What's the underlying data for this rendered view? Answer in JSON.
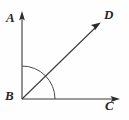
{
  "figure": {
    "type": "geometry-angle-diagram",
    "width": 129,
    "height": 120,
    "background_color": "#fefefe",
    "stroke_color": "#3a3a3a",
    "label_color": "#262626"
  },
  "vertex": {
    "name": "B",
    "label": "B",
    "x": 22,
    "y": 99
  },
  "rays": [
    {
      "name": "ray-BA",
      "label": "A",
      "from": "B",
      "to": "A",
      "direction": "up",
      "angle_degrees": 90,
      "tip_x": 22,
      "tip_y": 12,
      "has_arrowhead": true
    },
    {
      "name": "ray-BD",
      "label": "D",
      "from": "B",
      "to": "D",
      "direction": "up-right",
      "angle_degrees": 45,
      "tip_x": 101,
      "tip_y": 22,
      "has_arrowhead": true
    },
    {
      "name": "ray-BC",
      "label": "C",
      "from": "B",
      "to": "C",
      "direction": "right",
      "angle_degrees": 0,
      "tip_x": 119,
      "tip_y": 99,
      "has_arrowhead": true
    }
  ],
  "arc": {
    "name": "angle-arc-ABC",
    "center_x": 22,
    "center_y": 99,
    "radius": 33,
    "start_angle_degrees": 90,
    "end_angle_degrees": 0,
    "label": ""
  },
  "labels": {
    "a": "A",
    "b": "B",
    "c": "C",
    "d": "D"
  }
}
